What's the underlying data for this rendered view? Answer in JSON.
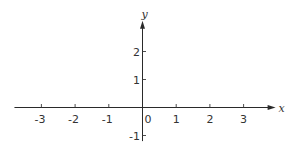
{
  "diagram": {
    "type": "cartesian-axes",
    "x_axis": {
      "label": "x",
      "range": [
        -3.8,
        3.95
      ],
      "ticks": [
        {
          "value": -3,
          "label": "-3"
        },
        {
          "value": -2,
          "label": "-2"
        },
        {
          "value": -1,
          "label": "-1"
        },
        {
          "value": 1,
          "label": "1"
        },
        {
          "value": 2,
          "label": "2"
        },
        {
          "value": 3,
          "label": "3"
        }
      ]
    },
    "y_axis": {
      "label": "y",
      "range": [
        -1.2,
        3.1
      ],
      "ticks": [
        {
          "value": 2,
          "label": "2"
        },
        {
          "value": 1,
          "label": "1"
        },
        {
          "value": -1,
          "label": "-1"
        }
      ]
    },
    "origin_label": "0",
    "colors": {
      "axis": "#2a2a2a",
      "text": "#333333",
      "background": "#ffffff"
    }
  }
}
